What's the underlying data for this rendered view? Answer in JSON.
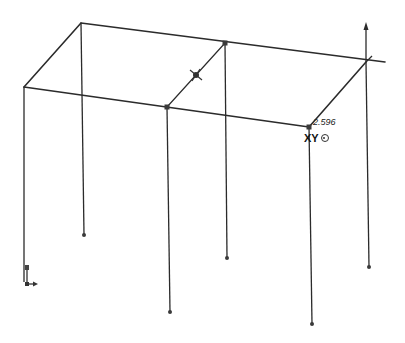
{
  "viewport": {
    "type": "3D sketch frame",
    "dimension_label": "2.596",
    "plane_label": "XY",
    "plane_icon": "origin-target-icon",
    "triad_icon": "coordinate-triad-icon",
    "axis_icon": "vertical-axis-arrow-icon",
    "midpoint_icon": "midpoint-constraint-icon"
  }
}
